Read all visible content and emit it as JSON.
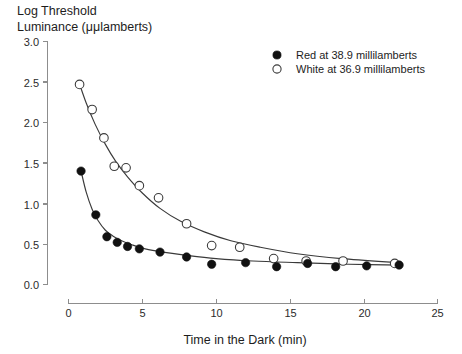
{
  "chart_data": {
    "type": "scatter",
    "title": "Log Threshold Luminance (μμlamberts)",
    "title_line1": "Log Threshold",
    "title_line2": "Luminance (μμlamberts)",
    "xlabel": "Time in the Dark (min)",
    "ylabel": "Log Threshold Luminance (μμlamberts)",
    "xlim": [
      0,
      25
    ],
    "ylim": [
      0,
      3.0
    ],
    "xticks": [
      0,
      5,
      10,
      15,
      20,
      25
    ],
    "xtick_labels": [
      "0",
      "5",
      "10",
      "15",
      "20",
      "25"
    ],
    "yticks": [
      0.0,
      0.5,
      1.0,
      1.5,
      2.0,
      2.5,
      3.0
    ],
    "ytick_labels": [
      "0.0",
      "0.5",
      "1.0",
      "1.5",
      "2.0",
      "2.5",
      "3.0"
    ],
    "grid": false,
    "legend_position": "top-right",
    "series": [
      {
        "name": "Red at 38.9 millilamberts",
        "marker": "filled-circle",
        "color": "#111111",
        "x": [
          0.85,
          1.85,
          2.6,
          3.3,
          4.0,
          4.8,
          6.2,
          8.0,
          9.7,
          12.0,
          14.1,
          16.2,
          18.1,
          20.2,
          22.4
        ],
        "y": [
          1.4,
          0.86,
          0.59,
          0.52,
          0.47,
          0.44,
          0.4,
          0.34,
          0.25,
          0.27,
          0.22,
          0.26,
          0.22,
          0.23,
          0.24
        ]
      },
      {
        "name": "White at 36.9 millilamberts",
        "marker": "open-circle",
        "color": "#ffffff",
        "x": [
          0.75,
          1.6,
          2.4,
          3.1,
          3.9,
          4.8,
          6.1,
          8.0,
          9.7,
          11.6,
          13.9,
          16.1,
          18.6,
          22.1
        ],
        "y": [
          2.47,
          2.16,
          1.81,
          1.46,
          1.44,
          1.22,
          1.07,
          0.75,
          0.48,
          0.46,
          0.32,
          0.29,
          0.29,
          0.26
        ]
      }
    ],
    "fit_curves": [
      {
        "name": "Red fit",
        "points_x": [
          0.85,
          1.2,
          1.6,
          2.0,
          2.5,
          3.0,
          3.6,
          4.3,
          5.2,
          6.4,
          8.0,
          10.0,
          12.5,
          15.5,
          19.0,
          22.6
        ],
        "points_y": [
          1.4,
          1.14,
          0.93,
          0.79,
          0.67,
          0.6,
          0.54,
          0.49,
          0.44,
          0.4,
          0.36,
          0.32,
          0.29,
          0.27,
          0.25,
          0.24
        ]
      },
      {
        "name": "White fit",
        "points_x": [
          0.7,
          1.2,
          1.8,
          2.5,
          3.2,
          4.0,
          5.0,
          6.2,
          7.6,
          9.2,
          11.0,
          13.0,
          15.5,
          18.5,
          22.3
        ],
        "points_y": [
          2.5,
          2.24,
          1.98,
          1.73,
          1.52,
          1.33,
          1.13,
          0.94,
          0.78,
          0.65,
          0.54,
          0.46,
          0.38,
          0.32,
          0.27
        ]
      }
    ],
    "legend": [
      {
        "marker": "filled-circle",
        "label": "Red at 38.9 millilamberts"
      },
      {
        "marker": "open-circle",
        "label": "White at 36.9 millilamberts"
      }
    ]
  },
  "colors": {
    "axis": "#8d8d8d",
    "curve": "#3a3a3a",
    "text": "#1d1d1d",
    "background": "#ffffff"
  }
}
